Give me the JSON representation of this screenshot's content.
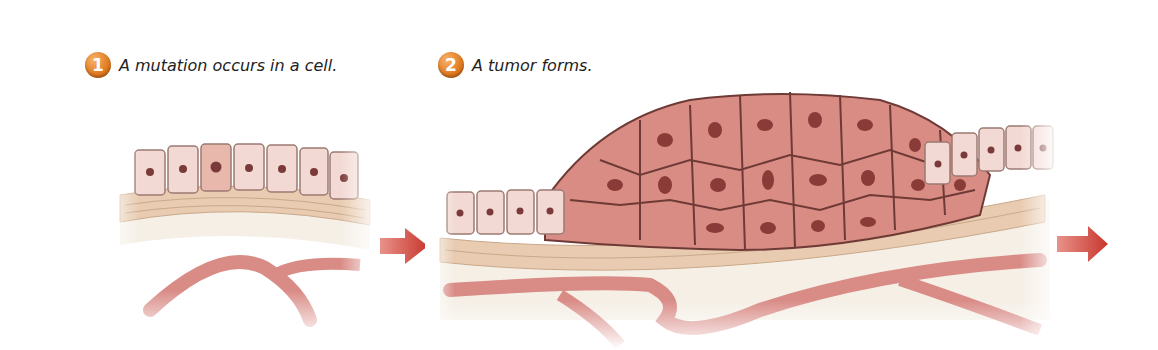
{
  "steps": [
    {
      "number": "1",
      "caption": "A mutation occurs in a cell."
    },
    {
      "number": "2",
      "caption": "A tumor forms."
    }
  ],
  "colors": {
    "step_badge": "#e07a1f",
    "normal_cell": "#f3d9d3",
    "mutated_cell": "#e9b8ad",
    "tumor_cell": "#d98c83",
    "nucleus": "#7a3a3a",
    "connective_tissue": "#e8cbb0",
    "blood_vessel": "#d98b86",
    "arrow": "#d5443a"
  },
  "icons": [
    "arrow-right-icon",
    "arrow-right-icon"
  ]
}
